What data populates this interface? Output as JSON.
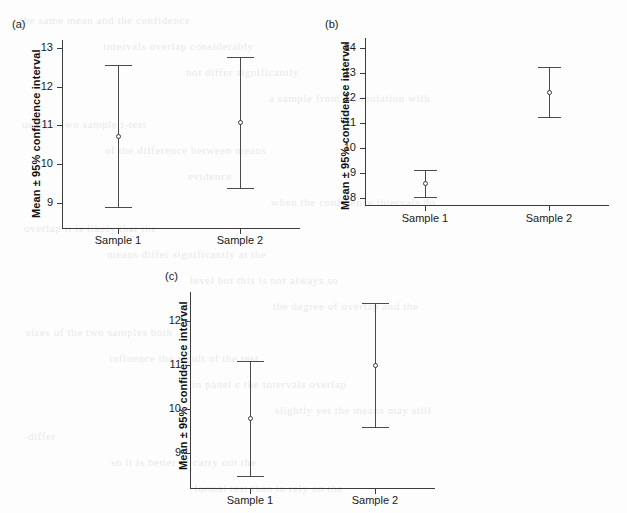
{
  "page": {
    "width": 627,
    "height": 513,
    "background_color": "#fdfdfd",
    "ink_color": "#3c3c3c"
  },
  "ghost_text": [
    "the same mean and the confidence",
    "intervals overlap considerably",
    "not differ significantly",
    "a sample from a population with",
    "using a two sample t-test",
    "of the difference between means",
    "evidence",
    "when the confidence intervals do",
    "overlap it is likely that the",
    "means differ significantly at the",
    "level but this is not always so",
    "the degree of overlap and the",
    "sizes of the two samples both",
    "influence the result of the test",
    "in panel c the intervals overlap",
    "slightly yet the means may still",
    "differ",
    "so it is better to carry out the",
    "formal test than to rely on the"
  ],
  "chart_data": [
    {
      "type": "scatter",
      "panel": "(a)",
      "title": "",
      "xlabel": "",
      "ylabel": "Mean ± 95% confidence interval",
      "categories": [
        "Sample 1",
        "Sample 2"
      ],
      "yticks": [
        9,
        10,
        11,
        12,
        13
      ],
      "ylim": [
        8.35,
        13.2
      ],
      "grid": false,
      "legend": "none",
      "series": [
        {
          "name": "Mean ± 95% CI",
          "means": [
            10.73,
            11.08
          ],
          "ci_lower": [
            8.9,
            9.37
          ],
          "ci_upper": [
            12.56,
            12.77
          ]
        }
      ]
    },
    {
      "type": "scatter",
      "panel": "(b)",
      "title": "",
      "xlabel": "",
      "ylabel": "Mean ± 95% confidence interval",
      "categories": [
        "Sample 1",
        "Sample 2"
      ],
      "yticks": [
        8,
        9,
        10,
        11,
        12,
        13,
        14
      ],
      "ylim": [
        7.7,
        14.4
      ],
      "grid": false,
      "legend": "none",
      "series": [
        {
          "name": "Mean ± 95% CI",
          "means": [
            8.57,
            12.22
          ],
          "ci_lower": [
            8.02,
            11.22
          ],
          "ci_upper": [
            9.1,
            13.23
          ]
        }
      ]
    },
    {
      "type": "scatter",
      "panel": "(c)",
      "title": "",
      "xlabel": "",
      "ylabel": "Mean ± 95% confidence interval",
      "categories": [
        "Sample 1",
        "Sample 2"
      ],
      "yticks": [
        9,
        10,
        11,
        12
      ],
      "ylim": [
        8.2,
        12.65
      ],
      "grid": false,
      "legend": "none",
      "series": [
        {
          "name": "Mean ± 95% CI",
          "means": [
            9.8,
            11.0
          ],
          "ci_lower": [
            8.47,
            9.58
          ],
          "ci_upper": [
            11.08,
            12.39
          ]
        }
      ]
    }
  ],
  "panels": [
    {
      "id": "a",
      "label": "(a)",
      "ylabel": "Mean ± 95% confidence interval",
      "xticklabels": [
        "Sample 1",
        "Sample 2"
      ]
    },
    {
      "id": "b",
      "label": "(b)",
      "ylabel": "Mean ± 95% confidence interval",
      "xticklabels": [
        "Sample 1",
        "Sample 2"
      ]
    },
    {
      "id": "c",
      "label": "(c)",
      "ylabel": "Mean ± 95% confidence interval",
      "xticklabels": [
        "Sample 1",
        "Sample 2"
      ]
    }
  ]
}
